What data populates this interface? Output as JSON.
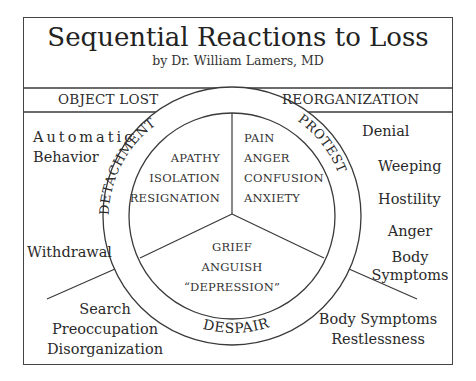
{
  "header": {
    "title": "Sequential Reactions to Loss",
    "subtitle": "by Dr. William Lamers, MD"
  },
  "band": {
    "left": "OBJECT LOST",
    "right": "REORGANIZATION"
  },
  "ring_labels": {
    "detachment": "DETACHMENT",
    "protest": "PROTEST",
    "despair": "DESPAIR"
  },
  "segments": {
    "detachment": [
      "APATHY",
      "ISOLATION",
      "RESIGNATION"
    ],
    "protest": [
      "PAIN",
      "ANGER",
      "CONFUSION",
      "ANXIETY"
    ],
    "despair": [
      "GRIEF",
      "ANGUISH",
      "“DEPRESSION”"
    ]
  },
  "outer_left": {
    "upper": [
      "Automatic",
      "Behavior"
    ],
    "middle": "Withdrawal",
    "lower": [
      "Search",
      "Preoccupation",
      "Disorganization"
    ]
  },
  "outer_right": {
    "upper": [
      "Denial",
      "Weeping",
      "Hostility",
      "Anger",
      "Body",
      "Symptoms"
    ],
    "lower": [
      "Body Symptoms",
      "Restlessness"
    ]
  },
  "colors": {
    "line": "#3a3a3a",
    "text": "#2a2a2a",
    "background": "#ffffff"
  }
}
